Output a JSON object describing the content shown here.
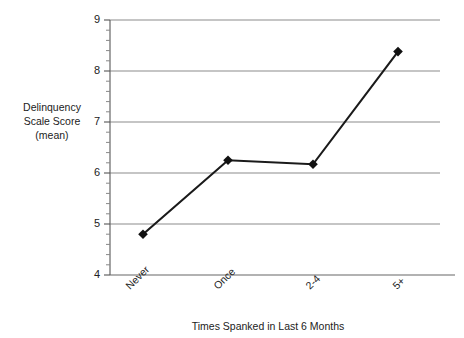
{
  "chart_data": {
    "type": "line",
    "title": "",
    "xlabel": "Times Spanked in Last 6 Months",
    "ylabel": "Delinquency Scale Score (mean)",
    "ylabel_lines": [
      "Delinquency",
      "Scale Score",
      "(mean)"
    ],
    "categories": [
      "Never",
      "Once",
      "2-4",
      "5+"
    ],
    "values": [
      4.8,
      6.25,
      6.17,
      8.38
    ],
    "series": [
      {
        "name": "Delinquency Scale Score (mean)",
        "values": [
          4.8,
          6.25,
          6.17,
          8.38
        ]
      }
    ],
    "ylim": [
      4,
      9
    ],
    "yticks": [
      4,
      5,
      6,
      7,
      8,
      9
    ],
    "ytick_labels": [
      "4",
      "5",
      "6",
      "7",
      "8",
      "9"
    ],
    "minor_ticks_per_interval": 5,
    "grid": "horizontal",
    "legend": "none",
    "marker": "diamond",
    "line_color": "#000000",
    "grid_color": "#8c8c8c",
    "axis_color": "#666666",
    "xtick_rotation": -45
  },
  "axis": {
    "y_tick_0": "9",
    "y_tick_1": "8",
    "y_tick_2": "7",
    "y_tick_3": "6",
    "y_tick_4": "5",
    "y_tick_5": "4",
    "x_tick_0": "Never",
    "x_tick_1": "Once",
    "x_tick_2": "2-4",
    "x_tick_3": "5+"
  },
  "labels": {
    "ylabel_line1": "Delinquency",
    "ylabel_line2": "Scale Score",
    "ylabel_line3": "(mean)",
    "xtitle": "Times Spanked in Last 6 Months"
  }
}
